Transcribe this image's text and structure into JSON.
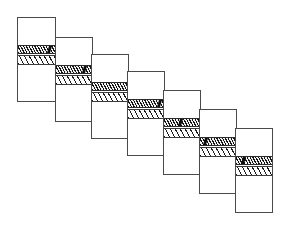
{
  "figure": {
    "background_color": "#ffffff",
    "outline_color": "#4a4a4a",
    "dark_band_color": "#8a8a8a",
    "light_band_color": "#ffffff",
    "hatch_color": "#141414",
    "panel_count": 7,
    "canvas": {
      "width": 283,
      "height": 226
    }
  },
  "panels": [
    {
      "index": 1,
      "name": "panel-1",
      "x": 17,
      "y": 17,
      "width": 39,
      "height": 85,
      "dark_band_top": 27,
      "dark_band_height": 9,
      "light_band_top": 37,
      "light_band_height": 10,
      "notch": {
        "present": true,
        "left_pct": 80,
        "width_pct": 9
      }
    },
    {
      "index": 2,
      "name": "panel-2",
      "x": 55,
      "y": 37,
      "width": 38,
      "height": 85,
      "dark_band_top": 27,
      "dark_band_height": 9,
      "light_band_top": 37,
      "light_band_height": 10,
      "notch": {
        "present": true,
        "left_pct": 74,
        "width_pct": 7
      }
    },
    {
      "index": 3,
      "name": "panel-3",
      "x": 91,
      "y": 54,
      "width": 38,
      "height": 85,
      "dark_band_top": 27,
      "dark_band_height": 9,
      "light_band_top": 37,
      "light_band_height": 10,
      "notch": {
        "present": false,
        "left_pct": 0,
        "width_pct": 0
      }
    },
    {
      "index": 4,
      "name": "panel-4",
      "x": 127,
      "y": 71,
      "width": 38,
      "height": 85,
      "dark_band_top": 27,
      "dark_band_height": 9,
      "light_band_top": 37,
      "light_band_height": 10,
      "notch": {
        "present": true,
        "left_pct": 82,
        "width_pct": 8
      }
    },
    {
      "index": 5,
      "name": "panel-5",
      "x": 163,
      "y": 90,
      "width": 38,
      "height": 85,
      "dark_band_top": 27,
      "dark_band_height": 9,
      "light_band_top": 37,
      "light_band_height": 10,
      "notch": {
        "present": true,
        "left_pct": 42,
        "width_pct": 8
      }
    },
    {
      "index": 6,
      "name": "panel-6",
      "x": 199,
      "y": 109,
      "width": 38,
      "height": 85,
      "dark_band_top": 27,
      "dark_band_height": 9,
      "light_band_top": 37,
      "light_band_height": 10,
      "notch": {
        "present": true,
        "left_pct": 12,
        "width_pct": 8
      }
    },
    {
      "index": 7,
      "name": "panel-7",
      "x": 235,
      "y": 128,
      "width": 38,
      "height": 85,
      "dark_band_top": 27,
      "dark_band_height": 9,
      "light_band_top": 37,
      "light_band_height": 10,
      "notch": {
        "present": true,
        "left_pct": 18,
        "width_pct": 9
      }
    }
  ]
}
